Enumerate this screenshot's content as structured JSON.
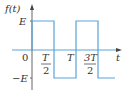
{
  "diagram": {
    "y_axis_label": "f(t)",
    "x_axis_label": "t",
    "origin_label": "0",
    "y_ticks": [
      "E",
      "−E"
    ],
    "x_ticks": [
      {
        "num": "T",
        "den": "2"
      },
      {
        "label": "T"
      },
      {
        "num": "3T",
        "den": "2"
      }
    ],
    "waveform": {
      "type": "square",
      "amplitude": "E",
      "segments": [
        {
          "from": "0",
          "to": "T/2",
          "value": "E"
        },
        {
          "from": "T/2",
          "to": "T",
          "value": "-E"
        },
        {
          "from": "T",
          "to": "3T/2",
          "value": "E"
        },
        {
          "from": "3T/2",
          "to": "end",
          "value": "-E"
        }
      ],
      "color": "#5aa3d9"
    },
    "axis_color": "#555555"
  }
}
